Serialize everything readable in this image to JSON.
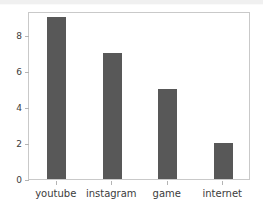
{
  "chart_data": {
    "type": "bar",
    "title": "",
    "xlabel": "",
    "ylabel": "",
    "categories": [
      "youtube",
      "instagram",
      "game",
      "internet"
    ],
    "values": [
      9,
      7,
      5,
      2
    ],
    "ylim": [
      0,
      9.35
    ],
    "yticks": [
      0,
      2,
      4,
      6,
      8
    ],
    "ytick_labels": [
      "0",
      "2",
      "4",
      "6",
      "8"
    ],
    "grid": false,
    "legend": null,
    "bar_color": "#585858",
    "axes_border_color": "#c9c9c9",
    "tick_color": "#b4b4b4",
    "text_color": "#3c3c3c",
    "background_color": "#ffffff",
    "top_strip_color": "#f0f0f0"
  }
}
